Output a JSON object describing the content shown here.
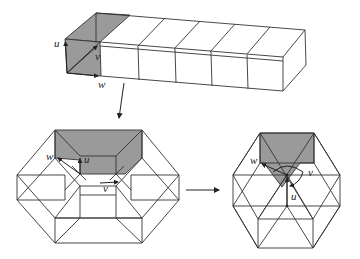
{
  "figure": {
    "panels": [
      {
        "id": "prism",
        "description": "Row of six cubes forming a rectangular prism; the first cube's front face and top face shaded gray, with basis vectors u, v, w at a corner",
        "labels": {
          "u": "u",
          "v": "v",
          "w": "w"
        }
      },
      {
        "id": "hexagon-left",
        "description": "Hexagonal projection of the cube chain wrapped into a ring; shaded region with basis vectors",
        "labels": {
          "u": "u",
          "v": "v",
          "w": "w"
        }
      },
      {
        "id": "hexagon-right",
        "description": "Collapsed hexagonal lattice with triangular subdivisions; shaded triangular region with rotation arc and vectors",
        "labels": {
          "u": "u",
          "v": "v",
          "w": "w"
        }
      }
    ],
    "arrows": [
      {
        "from": "prism",
        "to": "hexagon-left",
        "direction": "down"
      },
      {
        "from": "hexagon-left",
        "to": "hexagon-right",
        "direction": "right"
      }
    ],
    "colors": {
      "shade": "#9a9a9a",
      "line": "#333333",
      "background": "#ffffff"
    }
  }
}
